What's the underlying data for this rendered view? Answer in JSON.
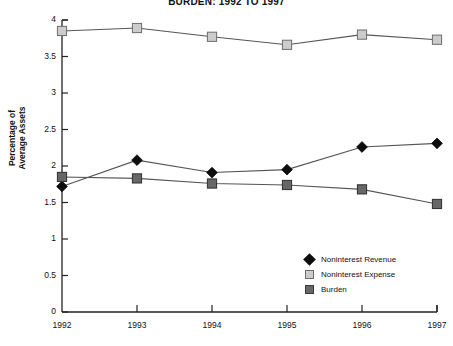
{
  "chart_data": {
    "type": "line",
    "title": "BURDEN: 1992 TO 1997",
    "xlabel": "",
    "ylabel": "Percentage of Average Assets",
    "categories": [
      "1992",
      "1993",
      "1994",
      "1995",
      "1996",
      "1997"
    ],
    "x": [
      1992,
      1993,
      1994,
      1995,
      1996,
      1997
    ],
    "ylim": [
      0,
      4
    ],
    "yticks": [
      "0",
      "0.5",
      "1",
      "1.5",
      "2",
      "2.5",
      "3",
      "3.5",
      "4"
    ],
    "ytick_values": [
      0,
      0.5,
      1,
      1.5,
      2,
      2.5,
      3,
      3.5,
      4
    ],
    "grid": false,
    "legend_position": "lower right",
    "series": [
      {
        "name": "Noninterest Revenue",
        "marker": "diamond",
        "color": "#0d0d0d",
        "values": [
          1.72,
          2.08,
          1.91,
          1.95,
          2.26,
          2.31
        ]
      },
      {
        "name": "Noninterest Expense",
        "marker": "square-light",
        "color": "#cccccc",
        "values": [
          3.85,
          3.89,
          3.77,
          3.66,
          3.8,
          3.73
        ]
      },
      {
        "name": "Burden",
        "marker": "square-dark",
        "color": "#676767",
        "values": [
          1.85,
          1.83,
          1.76,
          1.74,
          1.68,
          1.48
        ]
      }
    ]
  },
  "axis": {
    "x_labels": [
      "1992",
      "1993",
      "1994",
      "1995",
      "1996",
      "1997"
    ],
    "y_labels": [
      "4",
      "3.5",
      "3",
      "2.5",
      "2",
      "1.5",
      "1",
      "0.5",
      "0"
    ]
  },
  "legend": {
    "items": [
      {
        "label": "Noninterest Revenue",
        "marker": "diamond-marker"
      },
      {
        "label": "Noninterest Expense",
        "marker": "light-square-marker"
      },
      {
        "label": "Burden",
        "marker": "dark-square-marker"
      }
    ]
  }
}
